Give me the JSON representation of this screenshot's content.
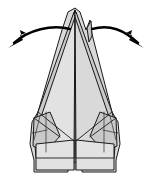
{
  "figure": {
    "background_color": "#ffffff",
    "paper_color": "#d9d9d9",
    "paper_highlight_color": "#e2e2e2",
    "paper_shadow_color": "#c9c9c9",
    "line_color": "#1a1a1a",
    "arrow_color": "#000000",
    "canvas": {
      "width": 150,
      "height": 187
    }
  },
  "model": {
    "name": "pointed-paper-model",
    "apex_label": "main peak",
    "secondary_spike_label": "secondary spike",
    "center_fold_label": "center vertical fold",
    "left_flap_label": "left lower flap",
    "right_flap_label": "right lower flap",
    "base_label": "flat notched base",
    "outline_points": "75,8 80,12 86,30 90,20 92,34 112,112 118,122 120,144 116,160 116,172 82,172 82,166 75,162 68,166 68,172 34,172 34,160 30,144 32,122 38,112 62,30 68,12",
    "left_body_points": "75,10 40,112 34,134 36,158 74,158 75,10",
    "right_body_points": "75,10 110,112 116,134 114,158 76,158 75,10",
    "left_edge_strip_points": "74,12 38,112 33,133 36,140 42,114 76,14",
    "right_edge_strip_points": "76,12 112,112 117,133 114,140 108,114 74,14",
    "secondary_spike_points": "87,28 91,21 92,36 89,42",
    "left_shoulder_points": "34,118 50,112 60,136 46,152 33,146",
    "right_shoulder_points": "116,118 100,112 90,136 104,152 117,146",
    "left_base_flap_points": "36,144 74,140 74,170 36,170",
    "right_base_flap_points": "114,144 76,140 76,170 114,170",
    "creases": [
      "M 75 10 L 75 170",
      "M 38 112 L 74 141",
      "M 112 112 L 76 141",
      "M 34 118 L 60 137",
      "M 116 118 L 90 137",
      "M 46 112 L 46 152",
      "M 104 112 L 104 152",
      "M 33 133 L 47 130",
      "M 117 133 L 103 130",
      "M 36 158 L 74 158",
      "M 114 158 L 76 158",
      "M 40 116 L 34 140",
      "M 110 116 L 116 140"
    ]
  },
  "arrows": [
    {
      "id": "left-pull-arrow",
      "label": "pull left flap outward to the left",
      "direction": "left",
      "path": "M 70 29 C 52 24, 28 30, 14 43",
      "head_points": "8,48 23,40 20,35 26,33 20,30 22,38"
    },
    {
      "id": "right-pull-arrow",
      "label": "pull right flap outward to the right",
      "direction": "right",
      "path": "M 92 29 C 110 24, 124 30, 138 43",
      "head_points": "144,48 129,40 132,35 126,33 132,30 130,38"
    }
  ]
}
